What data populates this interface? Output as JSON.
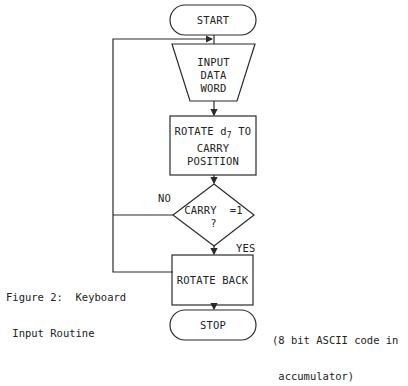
{
  "diagram": {
    "nodes": {
      "start": {
        "label": "START",
        "shape": "terminator"
      },
      "input": {
        "lines": [
          "INPUT",
          "DATA",
          "WORD"
        ],
        "shape": "manual-input"
      },
      "rotate": {
        "line1_pre": "ROTATE d",
        "line1_sub": "7",
        "line1_post": " TO",
        "line2": "CARRY",
        "line3": "POSITION",
        "shape": "process"
      },
      "decision": {
        "line1": "CARRY  =1",
        "line2": "?",
        "shape": "decision"
      },
      "rotate_back": {
        "label": "ROTATE BACK",
        "shape": "process"
      },
      "stop": {
        "label": "STOP",
        "shape": "terminator"
      }
    },
    "edges": {
      "no_label": "NO",
      "yes_label": "YES"
    },
    "caption": {
      "line1": "Figure 2:  Keyboard",
      "line2": " Input Routine"
    },
    "note": {
      "line1": "(8 bit ASCII code in",
      "line2": " accumulator)"
    }
  },
  "colors": {
    "stroke": "#2a2a2a",
    "background": "#ffffff"
  }
}
